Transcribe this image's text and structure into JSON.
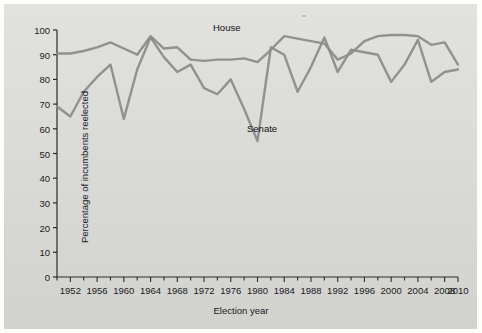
{
  "figure": {
    "background_color": "#d8d8d4",
    "series_color": "#8c8c8c",
    "axis_color": "#2b2b2b",
    "text_color": "#1a1a1a"
  },
  "chart_data": {
    "type": "line",
    "title": "",
    "xlabel": "Election year",
    "ylabel": "Percentage of incumbents reelected",
    "xlim": [
      1950,
      2010
    ],
    "ylim": [
      0,
      100
    ],
    "ytick_values": [
      0,
      10,
      20,
      30,
      40,
      50,
      60,
      70,
      80,
      90,
      100
    ],
    "ytick_labels": [
      "0",
      "10",
      "20",
      "30",
      "40",
      "50",
      "60",
      "70",
      "80",
      "90",
      "100"
    ],
    "xtick_values": [
      1952,
      1956,
      1960,
      1964,
      1968,
      1972,
      1976,
      1980,
      1984,
      1988,
      1992,
      1996,
      2000,
      2004,
      2008,
      2010
    ],
    "xtick_labels": [
      "1952",
      "1956",
      "1960",
      "1964",
      "1968",
      "1972",
      "1976",
      "1980",
      "1984",
      "1988",
      "1992",
      "1996",
      "2000",
      "2004",
      "2008",
      "2010"
    ],
    "minor_xtick_values": [
      1950,
      1954,
      1958,
      1962,
      1966,
      1970,
      1974,
      1978,
      1982,
      1986,
      1990,
      1994,
      1998,
      2002,
      2006
    ],
    "grid": false,
    "legend_position": "inline-annotations",
    "x": [
      1950,
      1952,
      1954,
      1956,
      1958,
      1960,
      1962,
      1964,
      1966,
      1968,
      1970,
      1972,
      1974,
      1976,
      1978,
      1980,
      1982,
      1984,
      1986,
      1988,
      1990,
      1992,
      1994,
      1996,
      1998,
      2000,
      2002,
      2004,
      2006,
      2008,
      2010
    ],
    "series": [
      {
        "name": "House",
        "label": "House",
        "color": "#8c8c8c",
        "values": [
          90.5,
          90.5,
          91.5,
          93.0,
          95.0,
          92.5,
          90.0,
          97.5,
          92.5,
          93.0,
          88.0,
          87.5,
          88.0,
          88.0,
          88.5,
          87.0,
          92.0,
          97.5,
          96.5,
          95.5,
          94.5,
          88.0,
          90.5,
          95.5,
          97.5,
          98.0,
          98.0,
          97.5,
          94.0,
          95.0,
          86.0
        ]
      },
      {
        "name": "Senate",
        "label": "Senate",
        "color": "#8c8c8c",
        "values": [
          69.0,
          65.0,
          75.0,
          81.0,
          86.0,
          64.0,
          84.0,
          97.0,
          89.0,
          83.0,
          86.0,
          76.5,
          74.0,
          80.0,
          68.0,
          55.0,
          93.0,
          90.0,
          75.0,
          85.0,
          97.0,
          83.0,
          92.0,
          91.0,
          90.0,
          79.0,
          86.0,
          96.0,
          79.0,
          83.0,
          84.0
        ]
      }
    ]
  },
  "labels": {
    "house": "House",
    "senate": "Senate"
  }
}
